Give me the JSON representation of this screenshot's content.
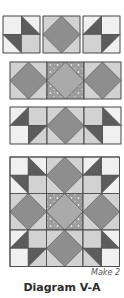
{
  "diagram": {
    "title": "Diagram V-A",
    "note": "Make 2",
    "colors": {
      "white": "#f0f0f0",
      "light": "#d2d2d2",
      "medium": "#b4b4b4",
      "diamond_dark": "#8e8e8e",
      "diamond_center": "#aaaaaa",
      "dark": "#5c5c5c",
      "speckle_bg": "#9c9c9c",
      "speckle_dot": "#e6e6e6",
      "stroke": "#4a4a4a"
    },
    "rows": [
      {
        "name": "row-1-units",
        "y": 16,
        "size": 37,
        "blocks": [
          {
            "x": 3,
            "type": "pinwheel-left"
          },
          {
            "x": 43,
            "type": "diamond-light"
          },
          {
            "x": 83,
            "type": "pinwheel-right"
          }
        ]
      },
      {
        "name": "row-2-units",
        "y": 62,
        "size": 37,
        "blocks": [
          {
            "x": 10,
            "type": "diamond-light"
          },
          {
            "x": 47,
            "type": "diamond-speckle"
          },
          {
            "x": 84,
            "type": "diamond-light"
          }
        ]
      },
      {
        "name": "row-3-units",
        "y": 107,
        "size": 37,
        "blocks": [
          {
            "x": 10,
            "type": "star-left"
          },
          {
            "x": 47,
            "type": "diamond-medium"
          },
          {
            "x": 84,
            "type": "star-right"
          }
        ]
      }
    ],
    "grid": {
      "name": "assembled-block",
      "x": 10,
      "y": 157,
      "size": 36.5,
      "blocks": [
        [
          "pinwheel-left",
          "diamond-medium",
          "pinwheel-right"
        ],
        [
          "diamond-light",
          "diamond-speckle",
          "diamond-light"
        ],
        [
          "star-left",
          "diamond-medium",
          "star-right"
        ]
      ]
    }
  }
}
